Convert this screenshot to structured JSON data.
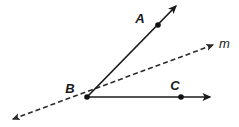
{
  "figure": {
    "kind": "geometry-diagram",
    "width": 239,
    "height": 127,
    "background_color": "#ffffff",
    "stroke_color": "#1a1a1a",
    "dashed_color": "#2b2b2b",
    "dash_pattern": "5,3"
  },
  "points": [
    {
      "id": "A",
      "label": "A",
      "dot": {
        "x": 158,
        "y": 25,
        "r": 2.8
      },
      "label_pos": {
        "x": 140,
        "y": 23
      }
    },
    {
      "id": "B",
      "label": "B",
      "dot": {
        "x": 87,
        "y": 97,
        "r": 2.8
      },
      "label_pos": {
        "x": 70,
        "y": 93
      }
    },
    {
      "id": "C",
      "label": "C",
      "dot": {
        "x": 181,
        "y": 97,
        "r": 2.8
      },
      "label_pos": {
        "x": 175,
        "y": 90
      }
    }
  ],
  "rays": [
    {
      "id": "ray-BA",
      "name": "ray-ba",
      "style": "solid",
      "from": {
        "x": 87,
        "y": 97
      },
      "to": {
        "x": 176,
        "y": 6
      },
      "arrow_end": true,
      "arrow_start": false
    },
    {
      "id": "ray-BC",
      "name": "ray-bc",
      "style": "solid",
      "from": {
        "x": 87,
        "y": 97
      },
      "to": {
        "x": 210,
        "y": 97
      },
      "arrow_end": true,
      "arrow_start": false
    }
  ],
  "lines": [
    {
      "id": "line-m",
      "label": "m",
      "name": "line-m",
      "style": "dashed",
      "from": {
        "x": 13,
        "y": 119
      },
      "to": {
        "x": 213,
        "y": 45
      },
      "arrow_end": true,
      "arrow_start": true,
      "label_pos": {
        "x": 219,
        "y": 48
      }
    }
  ]
}
